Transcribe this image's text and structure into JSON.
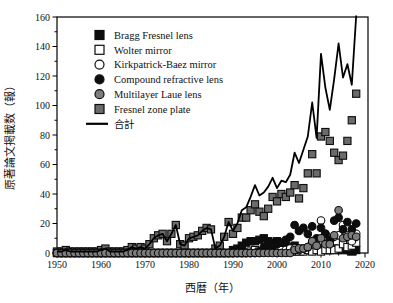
{
  "figure_title": "",
  "colors": {
    "background": "#ffffff",
    "axis": "#000000",
    "black_marker": "#0d0d0d",
    "gray_square": "#6b6b6b",
    "gray_circle": "#7d7d7d",
    "open_fill": "#ffffff",
    "total_line": "#000000"
  },
  "chart_data": {
    "type": "scatter",
    "title": "",
    "xlabel": "西暦（年）",
    "ylabel": "原著論文掲載数（報）",
    "xlim": [
      1950,
      2020
    ],
    "ylim": [
      0,
      160
    ],
    "x_ticks": [
      1950,
      1960,
      1970,
      1980,
      1990,
      2000,
      2010,
      2020
    ],
    "y_ticks": [
      0,
      20,
      40,
      60,
      80,
      100,
      120,
      140,
      160
    ],
    "x_minor_step": 2,
    "y_minor_step": 10,
    "grid": false,
    "legend_position": "upper-left-inside",
    "years": [
      1950,
      1951,
      1952,
      1953,
      1954,
      1955,
      1956,
      1957,
      1958,
      1959,
      1960,
      1961,
      1962,
      1963,
      1964,
      1965,
      1966,
      1967,
      1968,
      1969,
      1970,
      1971,
      1972,
      1973,
      1974,
      1975,
      1976,
      1977,
      1978,
      1979,
      1980,
      1981,
      1982,
      1983,
      1984,
      1985,
      1986,
      1987,
      1988,
      1989,
      1990,
      1991,
      1992,
      1993,
      1994,
      1995,
      1996,
      1997,
      1998,
      1999,
      2000,
      2001,
      2002,
      2003,
      2004,
      2005,
      2006,
      2007,
      2008,
      2009,
      2010,
      2011,
      2012,
      2013,
      2014,
      2015,
      2016,
      2017,
      2018
    ],
    "series": [
      {
        "name": "Bragg Fresnel lens",
        "marker": "square",
        "fill": "#0d0d0d",
        "edge": "#0d0d0d",
        "values": [
          0,
          0,
          0,
          0,
          0,
          0,
          0,
          0,
          0,
          0,
          0,
          0,
          0,
          0,
          0,
          0,
          0,
          0,
          0,
          0,
          0,
          0,
          0,
          0,
          0,
          0,
          0,
          0,
          0,
          0,
          0,
          0,
          0,
          0,
          0,
          0,
          0,
          0,
          0,
          0,
          2,
          3,
          5,
          7,
          8,
          8,
          9,
          10,
          8,
          7,
          8,
          6,
          5,
          4,
          5,
          3,
          2,
          3,
          2,
          2,
          3,
          2,
          2,
          3,
          2,
          2,
          2,
          1,
          2
        ]
      },
      {
        "name": "Wolter mirror",
        "marker": "square",
        "fill": "#ffffff",
        "edge": "#0d0d0d",
        "values": [
          0,
          0,
          0,
          0,
          0,
          0,
          0,
          0,
          0,
          0,
          0,
          0,
          0,
          0,
          0,
          0,
          0,
          0,
          0,
          0,
          0,
          0,
          0,
          0,
          0,
          0,
          0,
          0,
          0,
          0,
          0,
          0,
          0,
          0,
          0,
          0,
          0,
          0,
          0,
          0,
          0,
          0,
          0,
          0,
          1,
          2,
          1,
          1,
          1,
          1,
          1,
          1,
          2,
          1,
          1,
          1,
          1,
          2,
          1,
          2,
          1,
          2,
          2,
          2,
          3,
          6,
          4,
          5,
          7
        ]
      },
      {
        "name": "Kirkpatrick-Baez mirror",
        "marker": "circle",
        "fill": "#ffffff",
        "edge": "#0d0d0d",
        "values": [
          0,
          0,
          0,
          0,
          0,
          0,
          0,
          0,
          0,
          0,
          0,
          0,
          0,
          0,
          0,
          0,
          0,
          0,
          0,
          0,
          0,
          0,
          0,
          0,
          0,
          0,
          0,
          0,
          0,
          0,
          0,
          0,
          0,
          0,
          0,
          0,
          0,
          0,
          0,
          0,
          0,
          0,
          0,
          0,
          0,
          0,
          0,
          1,
          1,
          1,
          2,
          2,
          2,
          3,
          3,
          2,
          3,
          4,
          6,
          5,
          22,
          13,
          8,
          11,
          12,
          19,
          17,
          8,
          13
        ]
      },
      {
        "name": "Compound refractive lens",
        "marker": "circle",
        "fill": "#0d0d0d",
        "edge": "#0d0d0d",
        "values": [
          0,
          0,
          0,
          0,
          0,
          0,
          0,
          0,
          0,
          0,
          0,
          0,
          0,
          0,
          0,
          0,
          0,
          0,
          0,
          0,
          0,
          0,
          0,
          0,
          0,
          0,
          0,
          0,
          0,
          0,
          0,
          0,
          0,
          0,
          0,
          0,
          0,
          0,
          0,
          0,
          0,
          0,
          0,
          0,
          0,
          0,
          1,
          4,
          5,
          4,
          6,
          7,
          9,
          11,
          19,
          15,
          17,
          13,
          18,
          10,
          17,
          13,
          9,
          22,
          24,
          16,
          21,
          16,
          20
        ]
      },
      {
        "name": "Multilayer Laue lens",
        "marker": "circle",
        "fill": "#7d7d7d",
        "edge": "#0d0d0d",
        "values": [
          0,
          0,
          0,
          0,
          0,
          0,
          0,
          0,
          0,
          0,
          0,
          0,
          0,
          0,
          0,
          0,
          0,
          0,
          0,
          0,
          0,
          0,
          0,
          0,
          0,
          0,
          0,
          0,
          0,
          0,
          0,
          0,
          0,
          0,
          0,
          0,
          0,
          0,
          0,
          0,
          0,
          0,
          0,
          0,
          0,
          0,
          0,
          0,
          0,
          0,
          0,
          0,
          0,
          0,
          2,
          3,
          3,
          4,
          8,
          5,
          10,
          6,
          6,
          12,
          29,
          10,
          11,
          12,
          11
        ]
      },
      {
        "name": "Fresnel zone plate",
        "marker": "square",
        "fill": "#6b6b6b",
        "edge": "#0d0d0d",
        "values": [
          1,
          1,
          2,
          1,
          1,
          1,
          1,
          1,
          1,
          1,
          2,
          3,
          1,
          1,
          1,
          1,
          2,
          4,
          3,
          4,
          3,
          6,
          10,
          12,
          13,
          8,
          13,
          19,
          6,
          5,
          10,
          11,
          12,
          15,
          17,
          16,
          3,
          5,
          11,
          21,
          13,
          17,
          24,
          24,
          29,
          33,
          28,
          25,
          30,
          38,
          35,
          40,
          38,
          41,
          46,
          37,
          44,
          54,
          67,
          54,
          79,
          82,
          76,
          68,
          63,
          66,
          76,
          90,
          108
        ]
      }
    ],
    "total_series": {
      "name": "合計",
      "type": "line",
      "color": "#000000",
      "values": [
        1,
        1,
        2,
        1,
        1,
        1,
        1,
        1,
        1,
        1,
        2,
        3,
        1,
        1,
        1,
        1,
        2,
        4,
        3,
        4,
        3,
        6,
        10,
        12,
        13,
        8,
        13,
        19,
        6,
        5,
        10,
        11,
        12,
        15,
        17,
        16,
        3,
        5,
        11,
        21,
        15,
        20,
        29,
        31,
        38,
        46,
        39,
        41,
        45,
        51,
        44,
        49,
        48,
        53,
        68,
        61,
        70,
        79,
        102,
        78,
        135,
        112,
        97,
        118,
        142,
        119,
        128,
        114,
        161
      ]
    },
    "legend_entries": [
      {
        "label": "Bragg Fresnel lens",
        "icon": "filled-black-square-icon"
      },
      {
        "label": "Wolter mirror",
        "icon": "open-square-icon"
      },
      {
        "label": "Kirkpatrick-Baez mirror",
        "icon": "open-circle-icon"
      },
      {
        "label": "Compound refractive lens",
        "icon": "filled-black-circle-icon"
      },
      {
        "label": "Multilayer Laue lens",
        "icon": "filled-gray-circle-icon"
      },
      {
        "label": "Fresnel zone plate",
        "icon": "filled-gray-square-icon"
      },
      {
        "label": "合計",
        "icon": "solid-line-icon"
      }
    ]
  }
}
